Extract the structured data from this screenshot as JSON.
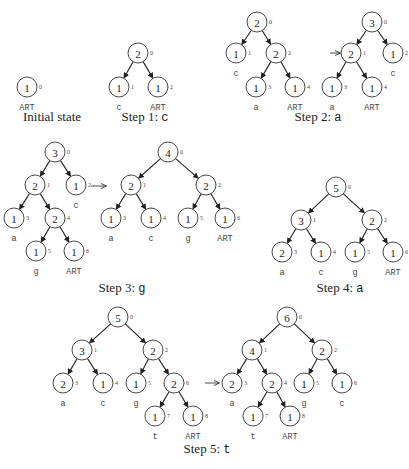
{
  "figure": {
    "width": 409,
    "height": 469,
    "node_radius": 10,
    "colors": {
      "stroke": "#333333",
      "text": "#222222",
      "background": "#ffffff"
    }
  },
  "panels": [
    {
      "id": "initial",
      "caption": {
        "prefix": "Initial state",
        "symbol": "",
        "x": 52,
        "y": 121
      },
      "nodes": [
        {
          "id": 0,
          "weight": "1",
          "index": "0",
          "x": 27,
          "y": 87,
          "label": "ART"
        }
      ],
      "edges": []
    },
    {
      "id": "step1",
      "caption": {
        "prefix": "Step 1: ",
        "symbol": "c",
        "x": 145,
        "y": 121
      },
      "nodes": [
        {
          "id": 0,
          "weight": "2",
          "index": "0",
          "x": 138,
          "y": 53,
          "label": ""
        },
        {
          "id": 1,
          "weight": "1",
          "index": "1",
          "x": 119,
          "y": 87,
          "label": "c"
        },
        {
          "id": 2,
          "weight": "1",
          "index": "2",
          "x": 158,
          "y": 87,
          "label": "ART"
        }
      ],
      "edges": [
        [
          0,
          1
        ],
        [
          0,
          2
        ]
      ]
    },
    {
      "id": "step2-before",
      "caption": null,
      "nodes": [
        {
          "id": 0,
          "weight": "2",
          "index": "0",
          "x": 257,
          "y": 22,
          "label": ""
        },
        {
          "id": 1,
          "weight": "1",
          "index": "1",
          "x": 236,
          "y": 53,
          "label": "c"
        },
        {
          "id": 2,
          "weight": "2",
          "index": "2",
          "x": 276,
          "y": 53,
          "label": ""
        },
        {
          "id": 3,
          "weight": "1",
          "index": "3",
          "x": 256,
          "y": 87,
          "label": "a"
        },
        {
          "id": 4,
          "weight": "1",
          "index": "4",
          "x": 295,
          "y": 87,
          "label": "ART"
        }
      ],
      "edges": [
        [
          0,
          1
        ],
        [
          0,
          2
        ],
        [
          2,
          3
        ],
        [
          2,
          4
        ]
      ]
    },
    {
      "id": "step2-after",
      "caption": {
        "prefix": "Step 2: ",
        "symbol": "a",
        "x": 318,
        "y": 121
      },
      "nodes": [
        {
          "id": 0,
          "weight": "3",
          "index": "0",
          "x": 372,
          "y": 22,
          "label": ""
        },
        {
          "id": 1,
          "weight": "2",
          "index": "1",
          "x": 351,
          "y": 53,
          "label": ""
        },
        {
          "id": 2,
          "weight": "1",
          "index": "2",
          "x": 393,
          "y": 53,
          "label": "c"
        },
        {
          "id": 3,
          "weight": "1",
          "index": "3",
          "x": 332,
          "y": 87,
          "label": "a"
        },
        {
          "id": 4,
          "weight": "1",
          "index": "4",
          "x": 372,
          "y": 87,
          "label": "ART"
        }
      ],
      "edges": [
        [
          0,
          1
        ],
        [
          0,
          2
        ],
        [
          1,
          3
        ],
        [
          1,
          4
        ]
      ]
    },
    {
      "id": "step3-before",
      "caption": null,
      "nodes": [
        {
          "id": 0,
          "weight": "3",
          "index": "0",
          "x": 55,
          "y": 152,
          "label": ""
        },
        {
          "id": 1,
          "weight": "2",
          "index": "1",
          "x": 35,
          "y": 185,
          "label": ""
        },
        {
          "id": 2,
          "weight": "1",
          "index": "2",
          "x": 76,
          "y": 185,
          "label": "c"
        },
        {
          "id": 3,
          "weight": "1",
          "index": "3",
          "x": 14,
          "y": 218,
          "label": "a"
        },
        {
          "id": 4,
          "weight": "2",
          "index": "4",
          "x": 55,
          "y": 218,
          "label": ""
        },
        {
          "id": 5,
          "weight": "1",
          "index": "5",
          "x": 36,
          "y": 251,
          "label": "g"
        },
        {
          "id": 6,
          "weight": "1",
          "index": "6",
          "x": 74,
          "y": 251,
          "label": "ART"
        }
      ],
      "edges": [
        [
          0,
          1
        ],
        [
          0,
          2
        ],
        [
          1,
          3
        ],
        [
          1,
          4
        ],
        [
          4,
          5
        ],
        [
          4,
          6
        ]
      ]
    },
    {
      "id": "step3-after",
      "caption": {
        "prefix": "Step 3: ",
        "symbol": "g",
        "x": 122,
        "y": 292
      },
      "nodes": [
        {
          "id": 0,
          "weight": "4",
          "index": "0",
          "x": 168,
          "y": 152,
          "label": ""
        },
        {
          "id": 1,
          "weight": "2",
          "index": "1",
          "x": 131,
          "y": 185,
          "label": ""
        },
        {
          "id": 2,
          "weight": "2",
          "index": "2",
          "x": 206,
          "y": 185,
          "label": ""
        },
        {
          "id": 3,
          "weight": "1",
          "index": "3",
          "x": 111,
          "y": 218,
          "label": "a"
        },
        {
          "id": 4,
          "weight": "1",
          "index": "4",
          "x": 151,
          "y": 218,
          "label": "c"
        },
        {
          "id": 5,
          "weight": "1",
          "index": "5",
          "x": 188,
          "y": 218,
          "label": "g"
        },
        {
          "id": 6,
          "weight": "1",
          "index": "6",
          "x": 225,
          "y": 218,
          "label": "ART"
        }
      ],
      "edges": [
        [
          0,
          1
        ],
        [
          0,
          2
        ],
        [
          1,
          3
        ],
        [
          1,
          4
        ],
        [
          2,
          5
        ],
        [
          2,
          6
        ]
      ]
    },
    {
      "id": "step4",
      "caption": {
        "prefix": "Step 4: ",
        "symbol": "a",
        "x": 340,
        "y": 292
      },
      "nodes": [
        {
          "id": 0,
          "weight": "5",
          "index": "0",
          "x": 336,
          "y": 187,
          "label": ""
        },
        {
          "id": 1,
          "weight": "3",
          "index": "1",
          "x": 301,
          "y": 220,
          "label": ""
        },
        {
          "id": 2,
          "weight": "2",
          "index": "2",
          "x": 372,
          "y": 220,
          "label": ""
        },
        {
          "id": 3,
          "weight": "2",
          "index": "3",
          "x": 282,
          "y": 252,
          "label": "a"
        },
        {
          "id": 4,
          "weight": "1",
          "index": "4",
          "x": 321,
          "y": 252,
          "label": "c"
        },
        {
          "id": 5,
          "weight": "1",
          "index": "5",
          "x": 355,
          "y": 252,
          "label": "g"
        },
        {
          "id": 6,
          "weight": "1",
          "index": "6",
          "x": 393,
          "y": 252,
          "label": "ART"
        }
      ],
      "edges": [
        [
          0,
          1
        ],
        [
          0,
          2
        ],
        [
          1,
          3
        ],
        [
          1,
          4
        ],
        [
          2,
          5
        ],
        [
          2,
          6
        ]
      ]
    },
    {
      "id": "step5-before",
      "caption": null,
      "nodes": [
        {
          "id": 0,
          "weight": "5",
          "index": "0",
          "x": 118,
          "y": 317,
          "label": ""
        },
        {
          "id": 1,
          "weight": "3",
          "index": "1",
          "x": 82,
          "y": 350,
          "label": ""
        },
        {
          "id": 2,
          "weight": "2",
          "index": "2",
          "x": 153,
          "y": 350,
          "label": ""
        },
        {
          "id": 3,
          "weight": "2",
          "index": "3",
          "x": 63,
          "y": 383,
          "label": "a"
        },
        {
          "id": 4,
          "weight": "1",
          "index": "4",
          "x": 103,
          "y": 383,
          "label": "c"
        },
        {
          "id": 5,
          "weight": "1",
          "index": "5",
          "x": 136,
          "y": 383,
          "label": "g"
        },
        {
          "id": 6,
          "weight": "2",
          "index": "6",
          "x": 174,
          "y": 383,
          "label": ""
        },
        {
          "id": 7,
          "weight": "1",
          "index": "7",
          "x": 155,
          "y": 416,
          "label": "t"
        },
        {
          "id": 8,
          "weight": "1",
          "index": "8",
          "x": 193,
          "y": 416,
          "label": "ART"
        }
      ],
      "edges": [
        [
          0,
          1
        ],
        [
          0,
          2
        ],
        [
          1,
          3
        ],
        [
          1,
          4
        ],
        [
          2,
          5
        ],
        [
          2,
          6
        ],
        [
          6,
          7
        ],
        [
          6,
          8
        ]
      ]
    },
    {
      "id": "step5-after",
      "caption": {
        "prefix": "Step 5: ",
        "symbol": "t",
        "x": 207,
        "y": 453
      },
      "nodes": [
        {
          "id": 0,
          "weight": "6",
          "index": "0",
          "x": 287,
          "y": 317,
          "label": ""
        },
        {
          "id": 1,
          "weight": "4",
          "index": "1",
          "x": 252,
          "y": 350,
          "label": ""
        },
        {
          "id": 2,
          "weight": "2",
          "index": "2",
          "x": 322,
          "y": 350,
          "label": ""
        },
        {
          "id": 3,
          "weight": "2",
          "index": "3",
          "x": 232,
          "y": 383,
          "label": "a"
        },
        {
          "id": 4,
          "weight": "2",
          "index": "4",
          "x": 272,
          "y": 383,
          "label": ""
        },
        {
          "id": 5,
          "weight": "1",
          "index": "5",
          "x": 304,
          "y": 383,
          "label": "g"
        },
        {
          "id": 6,
          "weight": "1",
          "index": "6",
          "x": 342,
          "y": 383,
          "label": "c"
        },
        {
          "id": 7,
          "weight": "1",
          "index": "7",
          "x": 253,
          "y": 416,
          "label": "t"
        },
        {
          "id": 8,
          "weight": "1",
          "index": "8",
          "x": 290,
          "y": 416,
          "label": "ART"
        }
      ],
      "edges": [
        [
          0,
          1
        ],
        [
          0,
          2
        ],
        [
          1,
          3
        ],
        [
          1,
          4
        ],
        [
          2,
          5
        ],
        [
          2,
          6
        ],
        [
          4,
          7
        ],
        [
          4,
          8
        ]
      ]
    }
  ],
  "transition_arrows": [
    {
      "x1": 330,
      "y1": 53,
      "x2": 340,
      "y2": 53
    },
    {
      "x1": 91,
      "y1": 186,
      "x2": 106,
      "y2": 186
    },
    {
      "x1": 205,
      "y1": 383,
      "x2": 219,
      "y2": 383
    }
  ],
  "captions_text": {
    "initial": "Initial state",
    "step1": "Step 1: c",
    "step2": "Step 2: a",
    "step3": "Step 3: g",
    "step4": "Step 4: a",
    "step5": "Step 5: t"
  }
}
